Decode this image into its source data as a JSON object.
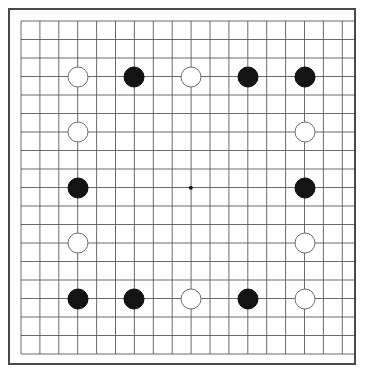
{
  "app": {
    "title": "Go Board",
    "board_type": "go-board",
    "size": 19,
    "board_label": "19x19 Go board"
  },
  "colors": {
    "background": "#ffffff",
    "board_background": "#ffffff",
    "border": "#4a4a4a",
    "grid_line": "#5a5a5a",
    "black_stone": "#141414",
    "white_stone": "#ffffff",
    "white_stone_outline": "#6e6e6e",
    "star_point": "#1a1a1a"
  },
  "geometry": {
    "image_width": 365,
    "image_height": 377,
    "board_left": 8,
    "board_top": 8,
    "board_width": 348,
    "board_height": 357,
    "grid_origin_x": 13,
    "grid_origin_y": 13,
    "grid_pitch_x": 18.9,
    "grid_pitch_y": 18.5,
    "lines": 19,
    "stone_diameter": 21
  },
  "star_points": [
    {
      "name": "tengen",
      "col": 9,
      "row": 9,
      "radius": 2.2
    }
  ],
  "stones": [
    {
      "id": "s1",
      "color": "black",
      "col": 6,
      "row": 3,
      "label": "black stone"
    },
    {
      "id": "s2",
      "color": "white",
      "col": 9,
      "row": 3,
      "label": "white stone"
    },
    {
      "id": "s3",
      "color": "black",
      "col": 12,
      "row": 3,
      "label": "black stone"
    },
    {
      "id": "s4",
      "color": "white",
      "col": 3,
      "row": 3,
      "label": "white stone"
    },
    {
      "id": "s5",
      "color": "black",
      "col": 15,
      "row": 3,
      "label": "black stone"
    },
    {
      "id": "s6",
      "color": "white",
      "col": 3,
      "row": 6,
      "label": "white stone"
    },
    {
      "id": "s7",
      "color": "white",
      "col": 15,
      "row": 6,
      "label": "white stone"
    },
    {
      "id": "s8",
      "color": "black",
      "col": 3,
      "row": 9,
      "label": "black stone"
    },
    {
      "id": "s9",
      "color": "black",
      "col": 15,
      "row": 9,
      "label": "black stone"
    },
    {
      "id": "s10",
      "color": "white",
      "col": 3,
      "row": 12,
      "label": "white stone"
    },
    {
      "id": "s11",
      "color": "white",
      "col": 15,
      "row": 12,
      "label": "white stone"
    },
    {
      "id": "s12",
      "color": "black",
      "col": 3,
      "row": 15,
      "label": "black stone"
    },
    {
      "id": "s13",
      "color": "black",
      "col": 6,
      "row": 15,
      "label": "black stone"
    },
    {
      "id": "s14",
      "color": "white",
      "col": 9,
      "row": 15,
      "label": "white stone"
    },
    {
      "id": "s15",
      "color": "black",
      "col": 12,
      "row": 15,
      "label": "black stone"
    },
    {
      "id": "s16",
      "color": "white",
      "col": 15,
      "row": 15,
      "label": "white stone"
    }
  ],
  "counts": {
    "black": 8,
    "white": 8,
    "total": 16
  }
}
